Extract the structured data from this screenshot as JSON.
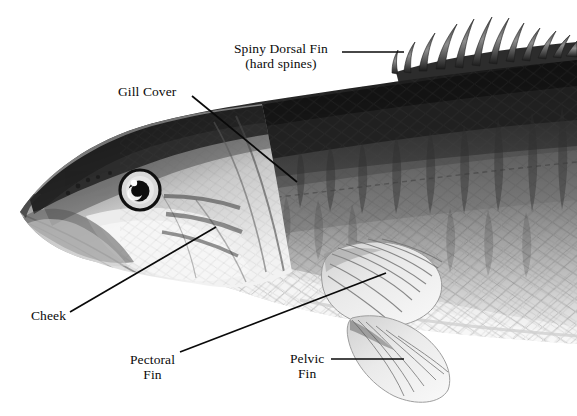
{
  "figure": {
    "style": "pencil-illustration-grayscale",
    "background_color": "#ffffff",
    "ink_color": "#0a0a0a"
  },
  "labels": [
    {
      "id": "spiny-dorsal-fin",
      "line1": "Spiny Dorsal Fin",
      "line2": "(hard spines)",
      "x": 234,
      "y": 41,
      "align": "center",
      "leader": {
        "x1": 342,
        "y1": 52,
        "x2": 404,
        "y2": 52
      }
    },
    {
      "id": "gill-cover",
      "line1": "Gill Cover",
      "line2": "",
      "x": 118,
      "y": 84,
      "align": "left",
      "leader": {
        "x1": 192,
        "y1": 96,
        "x2": 297,
        "y2": 182
      }
    },
    {
      "id": "cheek",
      "line1": "Cheek",
      "line2": "",
      "x": 31,
      "y": 308,
      "align": "left",
      "leader": {
        "x1": 70,
        "y1": 312,
        "x2": 216,
        "y2": 227
      }
    },
    {
      "id": "pectoral-fin",
      "line1": "Pectoral",
      "line2": "Fin",
      "x": 130,
      "y": 352,
      "align": "center",
      "leader": {
        "x1": 180,
        "y1": 352,
        "x2": 386,
        "y2": 273
      }
    },
    {
      "id": "pelvic-fin",
      "line1": "Pelvic",
      "line2": "Fin",
      "x": 290,
      "y": 351,
      "align": "center",
      "leader": {
        "x1": 331,
        "y1": 359,
        "x2": 404,
        "y2": 359
      }
    }
  ],
  "anatomy_parts": [
    "snout",
    "mouth",
    "eye",
    "cheek",
    "gill-cover",
    "spiny-dorsal-fin",
    "pectoral-fin",
    "pelvic-fin",
    "lateral-line",
    "scales",
    "body"
  ],
  "chart_data": {
    "type": "diagram",
    "callouts": [
      "Spiny Dorsal Fin (hard spines)",
      "Gill Cover",
      "Cheek",
      "Pectoral Fin",
      "Pelvic Fin"
    ]
  }
}
